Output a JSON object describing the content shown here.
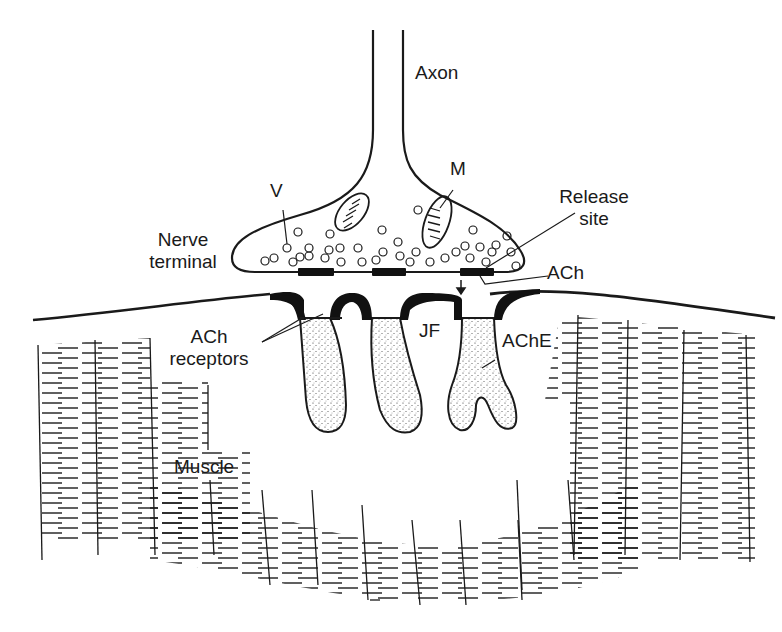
{
  "diagram": {
    "labels": {
      "axon": "Axon",
      "vesicle": "V",
      "mitochondrion": "M",
      "nerve_terminal_line1": "Nerve",
      "nerve_terminal_line2": "terminal",
      "release_site_line1": "Release",
      "release_site_line2": "site",
      "ach": "ACh",
      "ach_receptors_line1": "ACh",
      "ach_receptors_line2": "receptors",
      "junctional_fold": "JF",
      "ache": "AChE",
      "muscle": "Muscle"
    },
    "colors": {
      "ink": "#1a1a1a",
      "background": "#ffffff"
    }
  }
}
